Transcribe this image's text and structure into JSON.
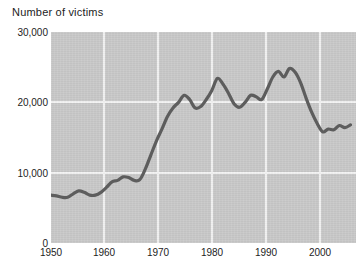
{
  "chart_data": {
    "type": "line",
    "title": "Number of victims",
    "xlabel": "",
    "ylabel": "Number of victims",
    "xlim": [
      1950,
      2005
    ],
    "ylim": [
      0,
      30000
    ],
    "grid": true,
    "legend": false,
    "y_ticks": [
      "0",
      "10,000",
      "20,000",
      "30,000"
    ],
    "y_tick_values": [
      0,
      10000,
      20000,
      30000
    ],
    "x_ticks": [
      "1950",
      "1960",
      "1970",
      "1980",
      "1990",
      "2000"
    ],
    "x_tick_values": [
      1950,
      1960,
      1970,
      1980,
      1990,
      2000
    ],
    "series": [
      {
        "name": "Number of victims",
        "color": "#5d5d5d",
        "x": [
          1950,
          1951,
          1952,
          1953,
          1954,
          1955,
          1956,
          1957,
          1958,
          1959,
          1960,
          1961,
          1962,
          1963,
          1964,
          1965,
          1966,
          1967,
          1968,
          1969,
          1970,
          1971,
          1972,
          1973,
          1974,
          1975,
          1976,
          1977,
          1978,
          1979,
          1980,
          1981,
          1982,
          1983,
          1984,
          1985,
          1986,
          1987,
          1988,
          1989,
          1990,
          1991,
          1992,
          1993,
          1994,
          1995,
          1996,
          1997,
          1998,
          1999,
          2000,
          2001,
          2002,
          2003,
          2004
        ],
        "values": [
          6800,
          6700,
          6500,
          6500,
          7000,
          7400,
          7200,
          6800,
          6800,
          7200,
          7900,
          8700,
          8900,
          9400,
          9300,
          8900,
          9000,
          10500,
          12500,
          14500,
          16200,
          18000,
          19200,
          20000,
          21000,
          20400,
          19200,
          19400,
          20400,
          21700,
          23400,
          22600,
          21300,
          19800,
          19300,
          20000,
          21000,
          20800,
          20400,
          21900,
          23600,
          24400,
          23600,
          24800,
          24300,
          22800,
          20600,
          18600,
          17000,
          15800,
          16200,
          16100,
          16700,
          16400,
          16800
        ]
      }
    ]
  }
}
